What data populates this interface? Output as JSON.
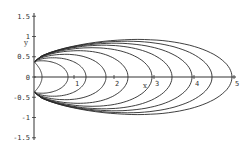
{
  "chart_data": {
    "type": "line",
    "title": "",
    "xlabel": "x",
    "ylabel": "y",
    "xlim": [
      0,
      5
    ],
    "ylim": [
      -1.5,
      1.5
    ],
    "grid": false,
    "legend": null,
    "x_ticks": [
      "1",
      "2",
      "3",
      "4",
      "5"
    ],
    "y_ticks": [
      "1.5",
      "1",
      "0.5",
      "0",
      "-0.5",
      "-1",
      "-1.5"
    ],
    "series": [
      {
        "name": "curve-1",
        "x_intercept": 0.2,
        "y_extent": 0.25
      },
      {
        "name": "curve-2",
        "x_intercept": 0.85,
        "y_extent": 0.45
      },
      {
        "name": "curve-3",
        "x_intercept": 1.3,
        "y_extent": 0.6
      },
      {
        "name": "curve-4",
        "x_intercept": 1.8,
        "y_extent": 0.75
      },
      {
        "name": "curve-5",
        "x_intercept": 2.35,
        "y_extent": 0.9
      },
      {
        "name": "curve-6",
        "x_intercept": 2.95,
        "y_extent": 1.02
      },
      {
        "name": "curve-7",
        "x_intercept": 3.45,
        "y_extent": 1.12
      },
      {
        "name": "curve-8",
        "x_intercept": 3.95,
        "y_extent": 1.2
      },
      {
        "name": "curve-9",
        "x_intercept": 4.45,
        "y_extent": 1.28
      },
      {
        "name": "curve-10",
        "x_intercept": 4.95,
        "y_extent": 1.35
      }
    ]
  },
  "axes": {
    "x_label": "x",
    "y_label": "y",
    "x_tick_labels": [
      "1",
      "2",
      "3",
      "4",
      "5"
    ],
    "y_tick_labels": [
      "1.5",
      "1",
      "0.5",
      "0",
      "-0.5",
      "-1",
      "-1.5"
    ],
    "origin_label": "0"
  },
  "style": {
    "line_color": "#2a2a2a",
    "axis_color": "#333333"
  }
}
